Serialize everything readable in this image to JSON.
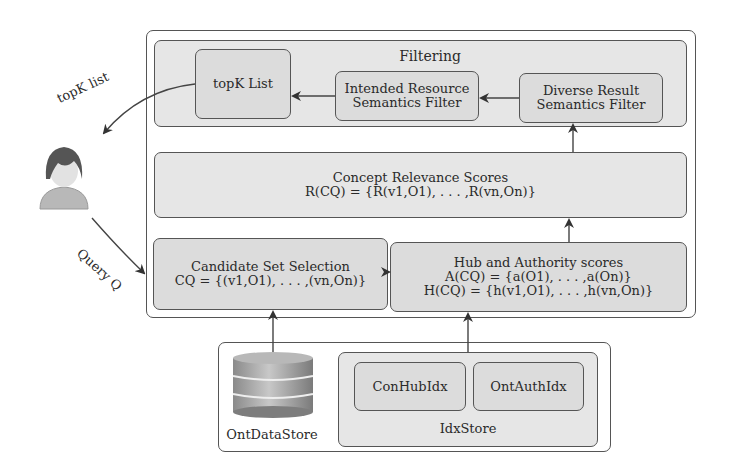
{
  "diagram": {
    "user_labels": {
      "topk_list_arrow": "topK list",
      "query_arrow": "Query Q"
    },
    "filtering": {
      "title": "Filtering",
      "topk_list": "topK List",
      "intended_filter": [
        "Intended Resource",
        "Semantics Filter"
      ],
      "diverse_filter": [
        "Diverse Result",
        "Semantics Filter"
      ]
    },
    "concept_relevance": {
      "title": "Concept Relevance Scores",
      "formula": "R(CQ) = {R(v1,O1), . . . ,R(vn,On)}"
    },
    "candidate_set": {
      "title": "Candidate Set Selection",
      "formula": "CQ = {(v1,O1), . . . ,(vn,On)}"
    },
    "hub_authority": {
      "title": "Hub and Authority scores",
      "formula_a": "A(CQ) = {a(O1), . . . ,a(On)}",
      "formula_h": "H(CQ) = {h(v1,O1), . . . ,h(vn,On)}"
    },
    "storage": {
      "ont_data_store": "OntDataStore",
      "idx_store": "IdxStore",
      "con_hub_idx": "ConHubIdx",
      "ont_auth_idx": "OntAuthIdx"
    }
  }
}
